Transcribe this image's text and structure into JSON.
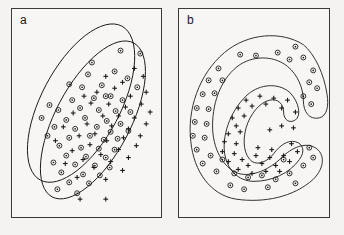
{
  "figure": {
    "background_color": "#f4f3f1",
    "ink_color": "#1a1a1a",
    "panel_border_color": "#3a3a3a"
  },
  "panels": [
    {
      "id": "a",
      "label": "a",
      "description": "Two overlapping elliptical cluster boundaries enclosing intermixed circle and plus markers",
      "boundary_type": "ellipse",
      "boundaries": [
        {
          "name": "upper-ellipse",
          "cx": 70,
          "cy": 95,
          "rx": 40,
          "ry": 88,
          "rotation_deg": 28
        },
        {
          "name": "lower-ellipse",
          "cx": 82,
          "cy": 112,
          "rx": 38,
          "ry": 88,
          "rotation_deg": 28
        }
      ]
    },
    {
      "id": "b",
      "label": "b",
      "description": "Two nested crescent (C-shaped) cluster boundaries; outer crescent holds circle markers, inner crescent holds plus markers",
      "boundary_type": "crescent",
      "boundaries": [
        {
          "name": "outer-crescent"
        },
        {
          "name": "inner-crescent"
        }
      ]
    }
  ],
  "markers": {
    "circle": {
      "name": "circle-marker",
      "glyph": "⊙",
      "meaning": "class-1",
      "color": "#1a1a1a"
    },
    "plus": {
      "name": "plus-marker",
      "glyph": "+",
      "meaning": "class-2",
      "color": "#1a1a1a"
    }
  },
  "chart_data": {
    "type": "scatter",
    "title": "",
    "xlabel": "",
    "ylabel": "",
    "grid": false,
    "legend": "none",
    "axis_ticks": false,
    "panels": [
      {
        "panel": "a",
        "label": "a",
        "xlim": [
          0,
          151
        ],
        "ylim": [
          0,
          210
        ],
        "series": [
          {
            "name": "circle-marker",
            "marker": "circle",
            "count": 54,
            "points": [
              [
                110,
                42
              ],
              [
                130,
                45
              ],
              [
                81,
                54
              ],
              [
                77,
                66
              ],
              [
                104,
                63
              ],
              [
                117,
                70
              ],
              [
                58,
                76
              ],
              [
                71,
                79
              ],
              [
                91,
                77
              ],
              [
                127,
                79
              ],
              [
                61,
                92
              ],
              [
                83,
                90
              ],
              [
                100,
                88
              ],
              [
                112,
                92
              ],
              [
                38,
                97
              ],
              [
                47,
                102
              ],
              [
                69,
                100
              ],
              [
                88,
                102
              ],
              [
                105,
                103
              ],
              [
                120,
                104
              ],
              [
                30,
                110
              ],
              [
                55,
                112
              ],
              [
                74,
                110
              ],
              [
                96,
                113
              ],
              [
                110,
                116
              ],
              [
                43,
                119
              ],
              [
                64,
                121
              ],
              [
                86,
                119
              ],
              [
                100,
                124
              ],
              [
                118,
                123
              ],
              [
                36,
                128
              ],
              [
                58,
                130
              ],
              [
                79,
                128
              ],
              [
                93,
                132
              ],
              [
                107,
                131
              ],
              [
                48,
                138
              ],
              [
                70,
                140
              ],
              [
                88,
                141
              ],
              [
                104,
                142
              ],
              [
                55,
                148
              ],
              [
                75,
                149
              ],
              [
                95,
                150
              ],
              [
                42,
                155
              ],
              [
                64,
                157
              ],
              [
                84,
                158
              ],
              [
                99,
                160
              ],
              [
                50,
                165
              ],
              [
                72,
                167
              ],
              [
                89,
                168
              ],
              [
                58,
                175
              ],
              [
                78,
                176
              ],
              [
                46,
                182
              ],
              [
                66,
                186
              ],
              [
                95,
                88
              ]
            ]
          },
          {
            "name": "plus-marker",
            "marker": "plus",
            "count": 44,
            "points": [
              [
                124,
                60
              ],
              [
                133,
                68
              ],
              [
                112,
                74
              ],
              [
                95,
                68
              ],
              [
                136,
                84
              ],
              [
                120,
                88
              ],
              [
                104,
                80
              ],
              [
                86,
                84
              ],
              [
                73,
                88
              ],
              [
                131,
                96
              ],
              [
                115,
                99
              ],
              [
                98,
                96
              ],
              [
                80,
                95
              ],
              [
                62,
                105
              ],
              [
                140,
                104
              ],
              [
                124,
                110
              ],
              [
                108,
                108
              ],
              [
                92,
                108
              ],
              [
                76,
                116
              ],
              [
                52,
                119
              ],
              [
                136,
                116
              ],
              [
                118,
                121
              ],
              [
                101,
                118
              ],
              [
                84,
                126
              ],
              [
                68,
                128
              ],
              [
                44,
                133
              ],
              [
                130,
                128
              ],
              [
                113,
                130
              ],
              [
                96,
                133
              ],
              [
                79,
                137
              ],
              [
                61,
                143
              ],
              [
                126,
                138
              ],
              [
                108,
                142
              ],
              [
                90,
                147
              ],
              [
                72,
                152
              ],
              [
                54,
                156
              ],
              [
                118,
                150
              ],
              [
                100,
                154
              ],
              [
                83,
                160
              ],
              [
                66,
                170
              ],
              [
                112,
                163
              ],
              [
                95,
                172
              ],
              [
                69,
                192
              ],
              [
                95,
                192
              ]
            ]
          }
        ]
      },
      {
        "panel": "b",
        "label": "b",
        "xlim": [
          0,
          152
        ],
        "ylim": [
          0,
          210
        ],
        "series": [
          {
            "name": "circle-marker",
            "marker": "circle",
            "count": 40,
            "points": [
              [
                118,
                38
              ],
              [
                62,
                46
              ],
              [
                78,
                47
              ],
              [
                100,
                44
              ],
              [
                112,
                51
              ],
              [
                126,
                49
              ],
              [
                40,
                60
              ],
              [
                136,
                62
              ],
              [
                30,
                72
              ],
              [
                44,
                72
              ],
              [
                132,
                74
              ],
              [
                24,
                86
              ],
              [
                36,
                85
              ],
              [
                140,
                80
              ],
              [
                126,
                88
              ],
              [
                18,
                100
              ],
              [
                30,
                101
              ],
              [
                134,
                96
              ],
              [
                16,
                114
              ],
              [
                28,
                116
              ],
              [
                14,
                128
              ],
              [
                26,
                130
              ],
              [
                18,
                142
              ],
              [
                32,
                148
              ],
              [
                44,
                152
              ],
              [
                24,
                156
              ],
              [
                38,
                164
              ],
              [
                56,
                166
              ],
              [
                70,
                170
              ],
              [
                84,
                168
              ],
              [
                98,
                172
              ],
              [
                112,
                166
              ],
              [
                126,
                158
              ],
              [
                136,
                150
              ],
              [
                132,
                140
              ],
              [
                52,
                178
              ],
              [
                66,
                182
              ],
              [
                90,
                180
              ],
              [
                118,
                176
              ],
              [
                106,
                152
              ]
            ]
          },
          {
            "name": "plus-marker",
            "marker": "plus",
            "count": 38,
            "points": [
              [
                68,
                92
              ],
              [
                82,
                88
              ],
              [
                96,
                90
              ],
              [
                110,
                92
              ],
              [
                60,
                100
              ],
              [
                74,
                98
              ],
              [
                88,
                96
              ],
              [
                104,
                100
              ],
              [
                118,
                104
              ],
              [
                54,
                110
              ],
              [
                66,
                108
              ],
              [
                58,
                118
              ],
              [
                50,
                126
              ],
              [
                62,
                124
              ],
              [
                46,
                134
              ],
              [
                58,
                136
              ],
              [
                44,
                144
              ],
              [
                56,
                146
              ],
              [
                50,
                154
              ],
              [
                64,
                152
              ],
              [
                70,
                158
              ],
              [
                84,
                156
              ],
              [
                78,
                148
              ],
              [
                92,
                150
              ],
              [
                98,
                158
              ],
              [
                106,
                148
              ],
              [
                112,
                154
              ],
              [
                120,
                144
              ],
              [
                114,
                136
              ],
              [
                88,
                164
              ],
              [
                74,
                166
              ],
              [
                60,
                162
              ],
              [
                102,
                164
              ],
              [
                94,
                142
              ],
              [
                80,
                140
              ],
              [
                92,
                122
              ],
              [
                104,
                118
              ],
              [
                116,
                120
              ]
            ]
          }
        ]
      }
    ]
  }
}
